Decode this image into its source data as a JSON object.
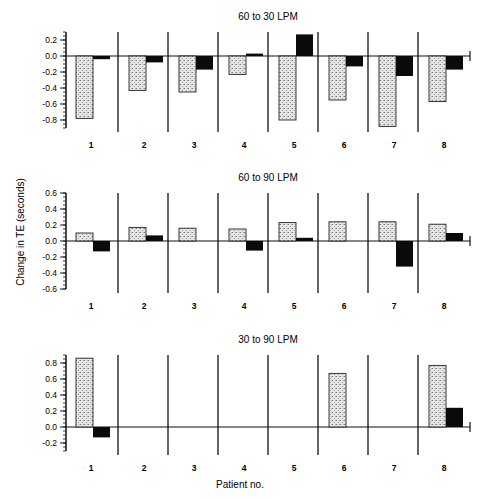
{
  "figure": {
    "ylabel": "Change in TE (seconds)",
    "xlabel": "Patient no.",
    "colors": {
      "stippled": "#d8d8d8",
      "solid": "#0a0a0a",
      "axis": "#111111"
    }
  },
  "chart_data": [
    {
      "type": "bar",
      "title": "60 to 30 LPM",
      "categories": [
        "1",
        "2",
        "3",
        "4",
        "5",
        "6",
        "7",
        "8"
      ],
      "series": [
        {
          "name": "stippled",
          "values": [
            -0.78,
            -0.43,
            -0.45,
            -0.23,
            -0.8,
            -0.55,
            -0.88,
            -0.57
          ]
        },
        {
          "name": "solid",
          "values": [
            -0.04,
            -0.08,
            -0.17,
            0.03,
            0.27,
            -0.13,
            -0.25,
            -0.17
          ]
        }
      ],
      "yticks": [
        "0.2",
        "0.0",
        "-0.2",
        "-0.4",
        "-0.6",
        "-0.8"
      ],
      "ylim": [
        -0.9,
        0.3
      ]
    },
    {
      "type": "bar",
      "title": "60 to 90 LPM",
      "categories": [
        "1",
        "2",
        "3",
        "4",
        "5",
        "6",
        "7",
        "8"
      ],
      "series": [
        {
          "name": "stippled",
          "values": [
            0.1,
            0.17,
            0.16,
            0.15,
            0.23,
            0.24,
            0.24,
            0.21
          ]
        },
        {
          "name": "solid",
          "values": [
            -0.13,
            0.07,
            0.0,
            -0.12,
            0.04,
            0.0,
            -0.32,
            0.1
          ]
        }
      ],
      "yticks": [
        "0.6",
        "0.4",
        "0.2",
        "0.0",
        "-0.2",
        "-0.4",
        "-0.6"
      ],
      "ylim": [
        -0.6,
        0.6
      ]
    },
    {
      "type": "bar",
      "title": "30 to 90 LPM",
      "categories": [
        "1",
        "2",
        "3",
        "4",
        "5",
        "6",
        "7",
        "8"
      ],
      "series": [
        {
          "name": "stippled",
          "values": [
            0.86,
            0.0,
            0.0,
            0.0,
            0.0,
            0.67,
            0.0,
            0.77
          ]
        },
        {
          "name": "solid",
          "values": [
            -0.13,
            0.0,
            0.0,
            0.0,
            0.0,
            0.0,
            0.0,
            0.24
          ]
        }
      ],
      "yticks": [
        "0.8",
        "0.6",
        "0.4",
        "0.2",
        "0.0",
        "-0.2"
      ],
      "ylim": [
        -0.3,
        0.9
      ]
    }
  ],
  "panels": [
    {
      "top": 32,
      "zeroY": 56,
      "pxPerUnit": 80
    },
    {
      "top": 193,
      "zeroY": 241,
      "pxPerUnit": 80
    },
    {
      "top": 355,
      "zeroY": 427,
      "pxPerUnit": 80
    }
  ]
}
